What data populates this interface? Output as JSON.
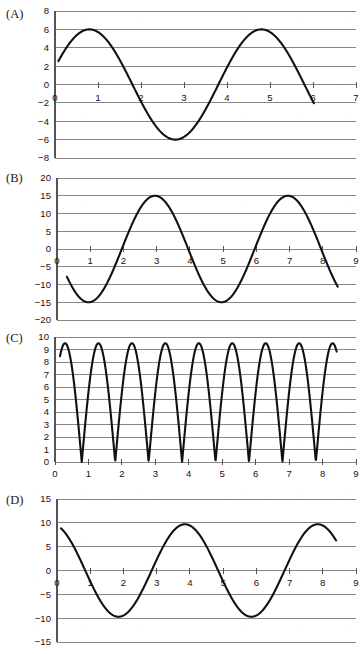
{
  "figure": {
    "title": "",
    "panel_count": 4,
    "background_color": "#ffffff",
    "curve_color": "#111111",
    "grid_color": "#7a7a7a",
    "axis_color": "#555555"
  },
  "panels": {
    "a": {
      "label": "(A)"
    },
    "b": {
      "label": "(B)"
    },
    "c": {
      "label": "(C)"
    },
    "d": {
      "label": "(D)"
    }
  },
  "chart_data": [
    {
      "id": "A",
      "type": "line",
      "title": "(A)",
      "xlabel": "",
      "ylabel": "",
      "xlim": [
        0,
        7
      ],
      "ylim": [
        -8,
        8
      ],
      "xticks": [
        0,
        1,
        2,
        3,
        4,
        5,
        6,
        7
      ],
      "xticklabels": [
        "0",
        "1",
        "2",
        "3",
        "4",
        "5",
        "6",
        "7"
      ],
      "yticks": [
        -8,
        -6,
        -4,
        -2,
        0,
        2,
        4,
        6,
        8
      ],
      "yticklabels": [
        "−8",
        "−6",
        "−4",
        "−2",
        "0",
        "2",
        "4",
        "6",
        "8"
      ],
      "grid": "horizontal",
      "legend": "none",
      "series": [
        {
          "name": "curve-a",
          "form": "sine",
          "amplitude": 6,
          "period": 4,
          "offset": 0,
          "x_at_first_max": 0.8,
          "x_start": 0.08,
          "x_end": 6.02,
          "y_start": 2.2,
          "y_end": -2.3,
          "points_note": "y = 6*sin(2*pi*(x-0.8)/4 + pi/2); max 6 at x=0.8 and x=4.8; min -6 at x=2.8"
        }
      ]
    },
    {
      "id": "B",
      "type": "line",
      "title": "(B)",
      "xlabel": "",
      "ylabel": "",
      "xlim": [
        0,
        9
      ],
      "ylim": [
        -20,
        20
      ],
      "xticks": [
        0,
        1,
        2,
        3,
        4,
        5,
        6,
        7,
        8,
        9
      ],
      "xticklabels": [
        "0",
        "1",
        "2",
        "3",
        "4",
        "5",
        "6",
        "7",
        "8",
        "9"
      ],
      "yticks": [
        -20,
        -15,
        -10,
        -5,
        0,
        5,
        10,
        15,
        20
      ],
      "yticklabels": [
        "−20",
        "−15",
        "−10",
        "−5",
        "0",
        "5",
        "10",
        "15",
        "20"
      ],
      "grid": "horizontal",
      "legend": "none",
      "series": [
        {
          "name": "curve-b",
          "form": "sine",
          "amplitude": 15,
          "period": 4,
          "offset": 0,
          "x_at_first_min": 0.95,
          "x_start": 0.3,
          "x_end": 8.45,
          "y_start": -7.8,
          "y_end": -11.0,
          "points_note": "y = 15*sin(2*pi*(x-2.95)/4); min -15 at x=0.95 and 4.95; max 15 at x=2.95 and 6.95"
        }
      ]
    },
    {
      "id": "C",
      "type": "line",
      "title": "(C)",
      "xlabel": "",
      "ylabel": "",
      "xlim": [
        0,
        9
      ],
      "ylim": [
        0,
        10
      ],
      "xticks": [
        0,
        1,
        2,
        3,
        4,
        5,
        6,
        7,
        8,
        9
      ],
      "xticklabels": [
        "0",
        "1",
        "2",
        "3",
        "4",
        "5",
        "6",
        "7",
        "8",
        "9"
      ],
      "yticks": [
        0,
        1,
        2,
        3,
        4,
        5,
        6,
        7,
        8,
        9,
        10
      ],
      "yticklabels": [
        "0",
        "1",
        "2",
        "3",
        "4",
        "5",
        "6",
        "7",
        "8",
        "9",
        "10"
      ],
      "grid": "horizontal",
      "legend": "none",
      "series": [
        {
          "name": "curve-c",
          "form": "rectified-sine",
          "amplitude": 9.5,
          "period": 2,
          "offset": 0,
          "x_at_first_min": 0.8,
          "x_start": 0.15,
          "x_end": 8.42,
          "y_start": 8.4,
          "y_end": 5.6,
          "points_note": "y = 9.5*|sin(pi*(x-0.8)/2)|; cusp minima ~0.2 at x=0.8,2.8,4.8,6.8; maxima 9.5 at x=1.8,3.8,5.8,7.8"
        }
      ]
    },
    {
      "id": "D",
      "type": "line",
      "title": "(D)",
      "xlabel": "",
      "ylabel": "",
      "xlim": [
        0,
        9
      ],
      "ylim": [
        -15,
        15
      ],
      "xticks": [
        0,
        1,
        2,
        3,
        4,
        5,
        6,
        7,
        8,
        9
      ],
      "xticklabels": [
        "0",
        "1",
        "2",
        "3",
        "4",
        "5",
        "6",
        "7",
        "8",
        "9"
      ],
      "yticks": [
        -15,
        -10,
        -5,
        0,
        5,
        10,
        15
      ],
      "yticklabels": [
        "−15",
        "−10",
        "−5",
        "0",
        "5",
        "10",
        "15"
      ],
      "grid": "horizontal",
      "legend": "none",
      "series": [
        {
          "name": "curve-d",
          "form": "sine",
          "amplitude": 9.7,
          "period": 4,
          "offset": 0,
          "x_at_first_max": 3.85,
          "x_start": 0.12,
          "x_end": 8.4,
          "y_start": 8.8,
          "y_end": 5.9,
          "points_note": "y = 9.7*sin(2*pi*(x-3.85)/4 + pi/2); min -9.7 at x=1.85 and 5.85; max 9.7 at x=3.85 and 7.85"
        }
      ]
    }
  ]
}
